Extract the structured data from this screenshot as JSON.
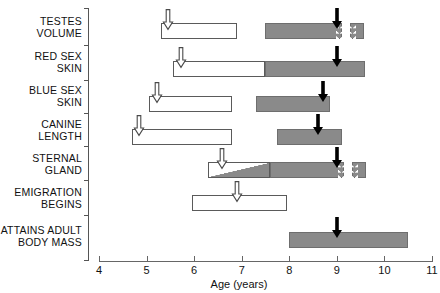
{
  "chart_data": {
    "type": "bar",
    "title": "",
    "subtitle": "",
    "xlabel": "Age (years)",
    "ylabel": "",
    "xlim": [
      4,
      11
    ],
    "xticks": [
      4,
      5,
      6,
      7,
      8,
      9,
      10,
      11
    ],
    "xtick_labels": [
      "4",
      "5",
      "6",
      "7",
      "8",
      "9",
      "10",
      "11"
    ],
    "grid": false,
    "legend_position": "none",
    "orientation": "horizontal",
    "categories": [
      "TESTES\nVOLUME",
      "RED SEX\nSKIN",
      "BLUE SEX\nSKIN",
      "CANINE\nLENGTH",
      "STERNAL\nGLAND",
      "EMIGRATION\nBEGINS",
      "ATTAINS ADULT\nBODY MASS"
    ],
    "series": [
      {
        "name": "TESTES VOLUME",
        "segments": [
          {
            "style": "open",
            "start": 5.3,
            "end": 6.9
          },
          {
            "style": "filled",
            "start": 7.5,
            "end": 9.1,
            "break_right": true
          },
          {
            "style": "filled",
            "start": 9.28,
            "end": 9.58,
            "break_left": true
          }
        ],
        "open_arrow": 5.45,
        "solid_arrow": 9.0
      },
      {
        "name": "RED SEX SKIN",
        "segments": [
          {
            "style": "open",
            "start": 5.55,
            "end": 7.5
          },
          {
            "style": "filled",
            "start": 7.5,
            "end": 9.6
          }
        ],
        "open_arrow": 5.72,
        "solid_arrow": 9.0
      },
      {
        "name": "BLUE SEX SKIN",
        "segments": [
          {
            "style": "open",
            "start": 5.05,
            "end": 6.8
          },
          {
            "style": "filled",
            "start": 7.3,
            "end": 8.85
          }
        ],
        "open_arrow": 5.22,
        "solid_arrow": 8.7
      },
      {
        "name": "CANINE LENGTH",
        "segments": [
          {
            "style": "open",
            "start": 4.7,
            "end": 6.8
          },
          {
            "style": "filled",
            "start": 7.75,
            "end": 9.1
          }
        ],
        "open_arrow": 4.85,
        "solid_arrow": 8.6
      },
      {
        "name": "STERNAL GLAND",
        "segments": [
          {
            "style": "diagonal",
            "start": 6.3,
            "end": 7.6
          },
          {
            "style": "filled",
            "start": 7.6,
            "end": 9.15,
            "break_right": true
          },
          {
            "style": "filled",
            "start": 9.32,
            "end": 9.62,
            "break_left": true
          }
        ],
        "open_arrow": 6.58,
        "solid_arrow": 9.0
      },
      {
        "name": "EMIGRATION BEGINS",
        "segments": [
          {
            "style": "open",
            "start": 5.95,
            "end": 7.95
          }
        ],
        "open_arrow": 6.9,
        "solid_arrow": null
      },
      {
        "name": "ATTAINS ADULT BODY MASS",
        "segments": [
          {
            "style": "filled",
            "start": 8.0,
            "end": 10.5
          }
        ],
        "open_arrow": null,
        "solid_arrow": 9.0
      }
    ],
    "colors": {
      "filled_bar": "#8a8a8a",
      "open_bar": "#ffffff",
      "bar_outline": "#5a5a5a",
      "axis": "#666666",
      "text": "#111111",
      "solid_arrow": "#000000",
      "open_arrow_fill": "#ffffff"
    }
  },
  "geometry": {
    "x_origin_px": 99,
    "px_per_year": 47.57,
    "row_centers_px": [
      31,
      69,
      104,
      137,
      170,
      203,
      240
    ],
    "row_label_centers_px": [
      27,
      62,
      96,
      130,
      164,
      198,
      236
    ],
    "bar_height_px": 16,
    "y_tick_positions_px": [
      8,
      45,
      80,
      113,
      146,
      180,
      215,
      261
    ]
  }
}
